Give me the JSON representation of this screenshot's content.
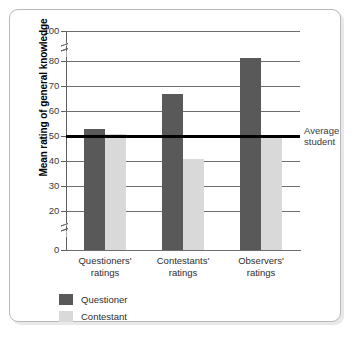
{
  "chart_data": {
    "type": "bar",
    "title": "",
    "subtitle": "",
    "xlabel": "",
    "ylabel": "Mean rating of general knowledge",
    "ylim": [
      0,
      100
    ],
    "yticks": [
      0,
      20,
      30,
      40,
      50,
      60,
      70,
      80,
      100
    ],
    "ytick_labels": [
      "0",
      "20",
      "30",
      "40",
      "50",
      "60",
      "70",
      "80",
      "100"
    ],
    "axis_break": true,
    "axis_break_segments": [
      "0-20",
      "80-100"
    ],
    "grid": "horizontal",
    "legend_position": "bottom-left",
    "categories": [
      "Questioners' ratings",
      "Contestants' ratings",
      "Observers' ratings"
    ],
    "category_lines": [
      [
        "Questioners'",
        "ratings"
      ],
      [
        "Contestants'",
        "ratings"
      ],
      [
        "Observers'",
        "ratings"
      ]
    ],
    "series": [
      {
        "name": "Questioner",
        "color": "#595959",
        "values": [
          53,
          67,
          82
        ]
      },
      {
        "name": "Contestant",
        "color": "#d9d9d9",
        "values": [
          51,
          41,
          50
        ]
      }
    ],
    "annotations": [
      {
        "name": "average-student-reference",
        "value": 50,
        "label": "Average student",
        "label_lines": [
          "Average",
          "student"
        ],
        "color": "#000000"
      }
    ]
  },
  "legend": {
    "items": [
      {
        "label": "Questioner",
        "color": "#595959"
      },
      {
        "label": "Contestant",
        "color": "#d9d9d9"
      }
    ]
  },
  "colors": {
    "questioner": "#595959",
    "contestant": "#d9d9d9",
    "reference_line": "#000000",
    "gridline": "#6d6d6d",
    "frame": "#b9b9bb",
    "background": "#ffffff"
  }
}
